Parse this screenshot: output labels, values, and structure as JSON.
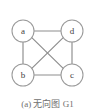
{
  "figure": {
    "caption": "(a) 无向图 G1",
    "width": 95,
    "height": 111,
    "background_color": "#ffffff",
    "edge_color": "#8d8d8d",
    "node_stroke_color": "#9a9a9a",
    "node_fill_color": "#ffffff",
    "label_color": "#3d3d3d",
    "caption_color": "#6f6f6f"
  },
  "chart_data": {
    "type": "diagram",
    "diagram_kind": "undirected-graph",
    "title": "(a) 无向图 G1",
    "graph_name": "G1",
    "directed": false,
    "node_count": 4,
    "edge_count": 6,
    "node_radius": 11,
    "nodes": [
      {
        "id": "a",
        "label": "a",
        "x": 23,
        "y": 31
      },
      {
        "id": "d",
        "label": "d",
        "x": 72,
        "y": 31
      },
      {
        "id": "b",
        "label": "b",
        "x": 23,
        "y": 75
      },
      {
        "id": "c",
        "label": "c",
        "x": 72,
        "y": 75
      }
    ],
    "edges": [
      {
        "from": "a",
        "to": "d",
        "x1": 34,
        "y1": 31,
        "x2": 61,
        "y2": 31
      },
      {
        "from": "b",
        "to": "c",
        "x1": 34,
        "y1": 75,
        "x2": 61,
        "y2": 75
      },
      {
        "from": "a",
        "to": "b",
        "x1": 23,
        "y1": 42,
        "x2": 23,
        "y2": 64
      },
      {
        "from": "d",
        "to": "c",
        "x1": 72,
        "y1": 42,
        "x2": 72,
        "y2": 64
      },
      {
        "from": "a",
        "to": "c",
        "x1": 31.8,
        "y1": 37.6,
        "x2": 63.2,
        "y2": 68.4
      },
      {
        "from": "b",
        "to": "d",
        "x1": 31.8,
        "y1": 68.4,
        "x2": 63.2,
        "y2": 37.6
      }
    ]
  }
}
